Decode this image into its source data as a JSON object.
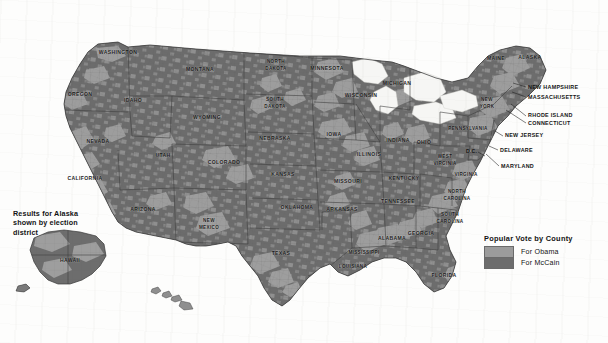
{
  "map": {
    "title_present": false,
    "projection_note": "2008 U.S. presidential election results shaded by county",
    "colors": {
      "obama": "#9c9c9c",
      "mccain": "#6d6d6d",
      "water": "#f4f4f2",
      "background": "#fdfdfc",
      "border": "#4a4a4a",
      "label": "#1c1c1c"
    },
    "state_labels": [
      {
        "name": "WASHINGTON",
        "x": 118,
        "y": 54
      },
      {
        "name": "OREGON",
        "x": 80,
        "y": 96
      },
      {
        "name": "IDAHO",
        "x": 133,
        "y": 102
      },
      {
        "name": "MONTANA",
        "x": 200,
        "y": 71
      },
      {
        "name": "WYOMING",
        "x": 207,
        "y": 119
      },
      {
        "name": "NEVADA",
        "x": 98,
        "y": 143
      },
      {
        "name": "CALIFORNIA",
        "x": 85,
        "y": 180
      },
      {
        "name": "UTAH",
        "x": 163,
        "y": 157
      },
      {
        "name": "ARIZONA",
        "x": 143,
        "y": 211
      },
      {
        "name": "COLORADO",
        "x": 224,
        "y": 164
      },
      {
        "name": "NEW MEXICO",
        "x": 209,
        "y": 225
      },
      {
        "name": "NORTH DAKOTA",
        "x": 276,
        "y": 66
      },
      {
        "name": "SOUTH DAKOTA",
        "x": 275,
        "y": 104
      },
      {
        "name": "NEBRASKA",
        "x": 275,
        "y": 140
      },
      {
        "name": "KANSAS",
        "x": 283,
        "y": 176
      },
      {
        "name": "OKLAHOMA",
        "x": 297,
        "y": 209
      },
      {
        "name": "TEXAS",
        "x": 281,
        "y": 255
      },
      {
        "name": "MINNESOTA",
        "x": 327,
        "y": 70
      },
      {
        "name": "IOWA",
        "x": 334,
        "y": 136
      },
      {
        "name": "MISSOURI",
        "x": 348,
        "y": 183
      },
      {
        "name": "ARKANSAS",
        "x": 342,
        "y": 211
      },
      {
        "name": "LOUISIANA",
        "x": 353,
        "y": 268
      },
      {
        "name": "MISSISSIPPI",
        "x": 364,
        "y": 254
      },
      {
        "name": "WISCONSIN",
        "x": 361,
        "y": 97
      },
      {
        "name": "ILLINOIS",
        "x": 369,
        "y": 156
      },
      {
        "name": "MICHIGAN",
        "x": 397,
        "y": 85
      },
      {
        "name": "INDIANA",
        "x": 398,
        "y": 142
      },
      {
        "name": "OHIO",
        "x": 424,
        "y": 144
      },
      {
        "name": "KENTUCKY",
        "x": 404,
        "y": 180
      },
      {
        "name": "TENNESSEE",
        "x": 398,
        "y": 203
      },
      {
        "name": "ALABAMA",
        "x": 392,
        "y": 240
      },
      {
        "name": "GEORGIA",
        "x": 421,
        "y": 235
      },
      {
        "name": "FLORIDA",
        "x": 444,
        "y": 277
      },
      {
        "name": "SOUTH CAROLINA",
        "x": 450,
        "y": 219
      },
      {
        "name": "NORTH CAROLINA",
        "x": 457,
        "y": 196
      },
      {
        "name": "VIRGINIA",
        "x": 466,
        "y": 176
      },
      {
        "name": "WEST VIRGINIA",
        "x": 445,
        "y": 161
      },
      {
        "name": "PENNSYLVANIA",
        "x": 468,
        "y": 130
      },
      {
        "name": "NEW YORK",
        "x": 487,
        "y": 104
      },
      {
        "name": "VERMONT",
        "x": 496,
        "y": 60
      },
      {
        "name": "MAINE",
        "x": 530,
        "y": 59
      },
      {
        "name": "ALASKA",
        "x": 70,
        "y": 262
      },
      {
        "name": "HAWAII",
        "x": 173,
        "y": 299
      }
    ],
    "leader_labels": [
      {
        "name": "NEW HAMPSHIRE",
        "text_x": 528,
        "text_y": 89,
        "line": "M 526,87 L 513,83"
      },
      {
        "name": "MASSACHUSETTS",
        "text_x": 528,
        "text_y": 99,
        "line": "M 526,97 L 512,92"
      },
      {
        "name": "RHODE ISLAND",
        "text_x": 528,
        "text_y": 117,
        "line": "M 526,116 L 511,104"
      },
      {
        "name": "CONNECTICUT",
        "text_x": 528,
        "text_y": 125,
        "line": "M 526,123 L 506,110"
      },
      {
        "name": "NEW JERSEY",
        "text_x": 505,
        "text_y": 137,
        "line": "M 503,136 L 495,131"
      },
      {
        "name": "DELAWARE",
        "text_x": 500,
        "text_y": 152,
        "line": "M 498,150 L 489,146"
      },
      {
        "name": "MARYLAND",
        "text_x": 501,
        "text_y": 168,
        "line": "M 499,166 L 486,154"
      },
      {
        "name": "D.C.",
        "text_x": 469,
        "text_y": 153,
        "line": "M 478,152 L 485,156"
      }
    ]
  },
  "legend": {
    "title": "Popular Vote by County",
    "entries": [
      {
        "label": "For Obama",
        "color": "#9c9c9c"
      },
      {
        "label": "For McCain",
        "color": "#6d6d6d"
      }
    ]
  },
  "annotations": {
    "alaska_note": "Results for Alaska shown by election district"
  }
}
